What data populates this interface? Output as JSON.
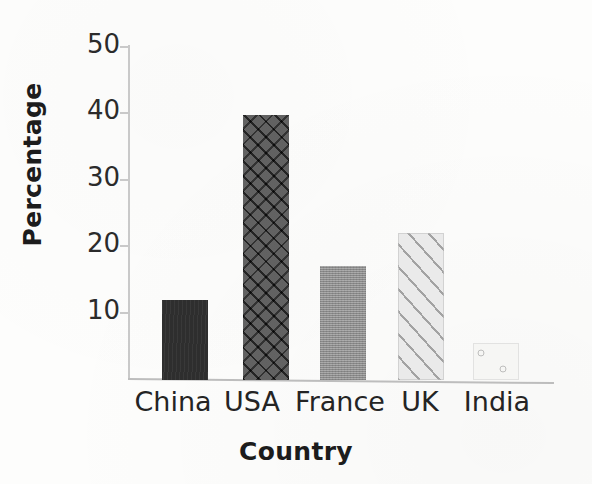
{
  "chart_data": {
    "type": "bar",
    "title": "",
    "subtitle": "",
    "xlabel": "Country",
    "ylabel": "Percentage",
    "categories": [
      "China",
      "USA",
      "France",
      "UK",
      "India"
    ],
    "values": [
      12,
      39.5,
      17,
      22,
      5.5
    ],
    "series": [
      {
        "name": "Percentage",
        "values": [
          12,
          39.5,
          17,
          22,
          5.5
        ]
      }
    ],
    "ylim": [
      0,
      50
    ],
    "xlim": null,
    "ytick_labels": [
      "10",
      "20",
      "30",
      "40",
      "50"
    ],
    "ytick_values": [
      10,
      20,
      30,
      40,
      50
    ],
    "grid": false,
    "legend": false,
    "legend_position": "none",
    "annotations": [],
    "bar_styles": [
      {
        "category": "China",
        "fill": "solid-dark",
        "color": "#2e2e2e"
      },
      {
        "category": "USA",
        "fill": "crosshatch-dark",
        "color": "#3c3c3c"
      },
      {
        "category": "France",
        "fill": "solid-gray",
        "color": "#9c9c9c"
      },
      {
        "category": "UK",
        "fill": "diagonal-stripes",
        "color": "#eaeaea"
      },
      {
        "category": "India",
        "fill": "circles-light",
        "color": "#f6f6f4"
      }
    ]
  },
  "axes": {
    "y_ticks": [
      {
        "label": "50",
        "value": 50
      },
      {
        "label": "40",
        "value": 40
      },
      {
        "label": "30",
        "value": 30
      },
      {
        "label": "20",
        "value": 20
      },
      {
        "label": "10",
        "value": 10
      }
    ],
    "x_categories": [
      {
        "label": "China"
      },
      {
        "label": "USA"
      },
      {
        "label": "France"
      },
      {
        "label": "UK"
      },
      {
        "label": "India"
      }
    ]
  },
  "colors": {
    "background": "#fdfdfc",
    "axis": "#c9c9c9",
    "text": "#242424",
    "title_text": "#1c1c1c"
  }
}
